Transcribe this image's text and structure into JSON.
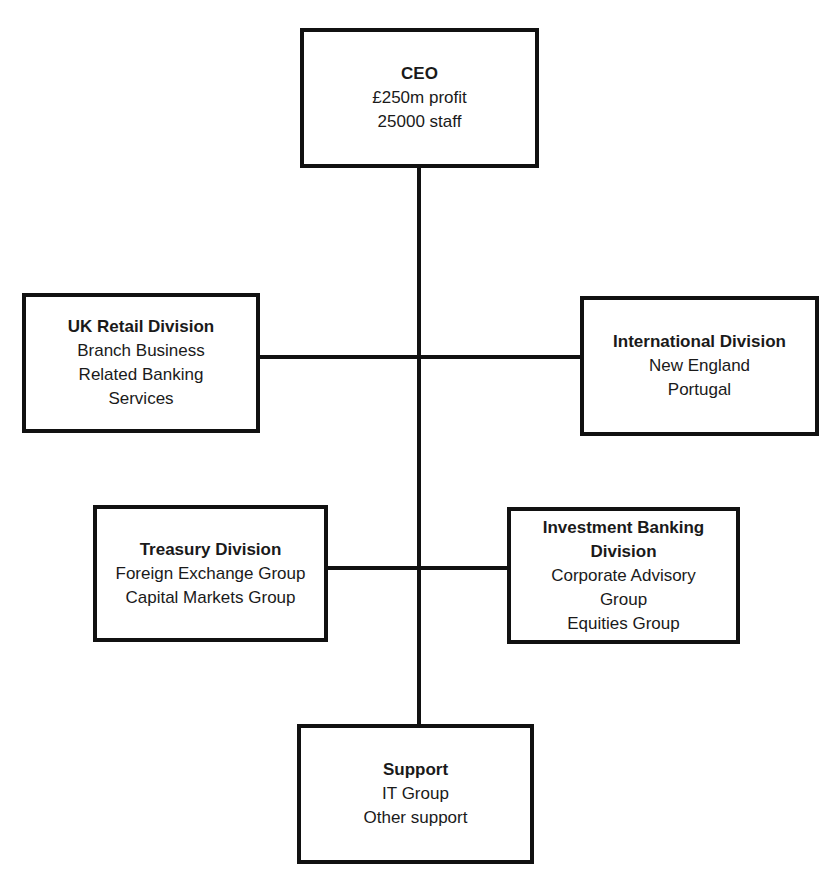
{
  "diagram": {
    "type": "organization-chart",
    "nodes": [
      {
        "id": "ceo",
        "title": "CEO",
        "lines": [
          "£250m profit",
          "25000 staff"
        ]
      },
      {
        "id": "uk_retail",
        "title": "UK Retail Division",
        "lines": [
          "Branch Business",
          "Related Banking",
          "Services"
        ]
      },
      {
        "id": "international",
        "title": "International Division",
        "lines": [
          "New England",
          "Portugal"
        ]
      },
      {
        "id": "treasury",
        "title": "Treasury Division",
        "lines": [
          "Foreign Exchange Group",
          "Capital Markets Group"
        ]
      },
      {
        "id": "investment_banking",
        "title": "Investment Banking Division",
        "title_lines": [
          "Investment Banking",
          "Division"
        ],
        "lines": [
          "Corporate Advisory",
          "Group",
          "Equities Group"
        ]
      },
      {
        "id": "support",
        "title": "Support",
        "lines": [
          "IT Group",
          "Other support"
        ]
      }
    ],
    "edges": [
      [
        "ceo",
        "uk_retail"
      ],
      [
        "ceo",
        "international"
      ],
      [
        "ceo",
        "treasury"
      ],
      [
        "ceo",
        "investment_banking"
      ],
      [
        "ceo",
        "support"
      ]
    ]
  },
  "boxes": {
    "ceo": {
      "title": "CEO",
      "l1": "£250m profit",
      "l2": "25000 staff"
    },
    "uk_retail": {
      "title": "UK Retail Division",
      "l1": "Branch Business",
      "l2": "Related Banking",
      "l3": "Services"
    },
    "international": {
      "title": "International Division",
      "l1": "New England",
      "l2": "Portugal"
    },
    "treasury": {
      "title": "Treasury Division",
      "l1": "Foreign Exchange Group",
      "l2": "Capital Markets Group"
    },
    "investment_banking": {
      "title1": "Investment Banking",
      "title2": "Division",
      "l1": "Corporate Advisory",
      "l2": "Group",
      "l3": "Equities Group"
    },
    "support": {
      "title": "Support",
      "l1": "IT Group",
      "l2": "Other support"
    }
  },
  "colors": {
    "line": "#111111",
    "text": "#1a1a1a",
    "background": "#ffffff"
  }
}
